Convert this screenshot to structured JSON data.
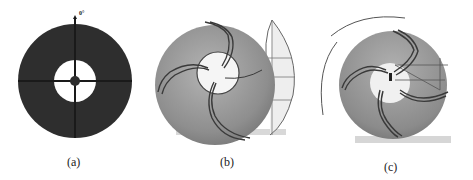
{
  "figure": {
    "panels": [
      {
        "id": "a",
        "caption": "(a)",
        "description": "Annular disk with crosshair axes",
        "angle_label": "0°",
        "disk_color": "#2e2e2e",
        "hole_color": "#ffffff"
      },
      {
        "id": "b",
        "caption": "(b)",
        "description": "Disk with three curved spiral blades and lens-shaped construction outline"
      },
      {
        "id": "c",
        "caption": "(c)",
        "description": "Disk with three swept spiral blades and outer guide arc"
      }
    ]
  },
  "colors": {
    "disk_dark": "#2e2e2e",
    "disk_gray": "#8a8a8a",
    "disk_gray_light": "#a9a9a9",
    "blade_line": "#3a3a3a",
    "shadow": "#d6d6d6",
    "construction": "#6a6a6a"
  }
}
